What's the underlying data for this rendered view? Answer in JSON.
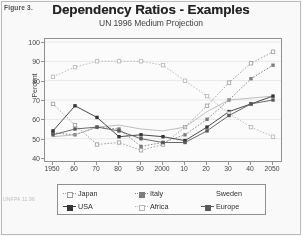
{
  "figure_label": "Figure 3.",
  "footer_note": "UNFPA\n11.96",
  "chart_data": {
    "type": "line",
    "title": "Dependency Ratios - Examples",
    "subtitle": "UN 1996 Medium Projection",
    "xlabel": "",
    "ylabel": "Percent",
    "ylim": [
      40,
      100
    ],
    "ytick_values": [
      40,
      50,
      60,
      70,
      80,
      90,
      100
    ],
    "ytick_labels": [
      "40",
      "50",
      "60",
      "70",
      "80",
      "90",
      "100"
    ],
    "x": [
      1950,
      1960,
      1970,
      1980,
      1990,
      2000,
      2010,
      2020,
      2030,
      2040,
      2050
    ],
    "xtick_labels": [
      "1950",
      "60",
      "70",
      "80",
      "90",
      "2000",
      "10",
      "20",
      "30",
      "40",
      "2050"
    ],
    "grid": true,
    "legend_position": "bottom",
    "series": [
      {
        "name": "Japan",
        "marker": "square-open",
        "style": "dotted",
        "color": "#9a9a9a",
        "values": [
          68,
          57,
          47,
          48,
          44,
          47,
          56,
          67,
          79,
          89,
          95
        ]
      },
      {
        "name": "Italy",
        "marker": "square-filled",
        "style": "dotted",
        "color": "#7a7a7a",
        "values": [
          53,
          52,
          56,
          55,
          46,
          48,
          52,
          60,
          70,
          81,
          88
        ]
      },
      {
        "name": "Sweden",
        "marker": "none",
        "style": "solid",
        "color": "#adadad",
        "values": [
          51,
          52,
          56,
          57,
          55,
          54,
          56,
          64,
          70,
          71,
          72
        ]
      },
      {
        "name": "USA",
        "marker": "square-filled",
        "style": "solid",
        "color": "#2e2e2e",
        "values": [
          54,
          67,
          61,
          51,
          52,
          51,
          49,
          56,
          64,
          68,
          72
        ]
      },
      {
        "name": "Africa",
        "marker": "square-open",
        "style": "dotted",
        "color": "#b5b5b5",
        "values": [
          82,
          87,
          90,
          90,
          90,
          88,
          80,
          72,
          63,
          56,
          51
        ]
      },
      {
        "name": "Europe",
        "marker": "square-filled",
        "style": "solid",
        "color": "#555555",
        "values": [
          52,
          55,
          56,
          54,
          50,
          48,
          48,
          54,
          62,
          68,
          70
        ]
      }
    ]
  }
}
